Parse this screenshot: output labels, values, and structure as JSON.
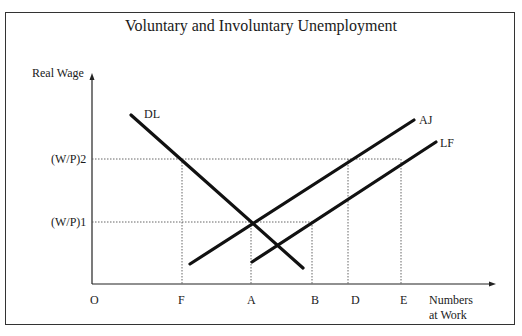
{
  "title": "Voluntary and Involuntary Unemployment",
  "axes": {
    "y_label": "Real Wage",
    "x_label_line1": "Numbers",
    "x_label_line2": "at Work",
    "origin": "O"
  },
  "y_ticks": {
    "wp2": "(W/P)2",
    "wp1": "(W/P)1"
  },
  "x_ticks": {
    "F": "F",
    "A": "A",
    "B": "B",
    "D": "D",
    "E": "E"
  },
  "curves": {
    "DL": "DL",
    "AJ": "AJ",
    "LF": "LF"
  },
  "colors": {
    "line": "#111111",
    "guide": "#555555"
  }
}
